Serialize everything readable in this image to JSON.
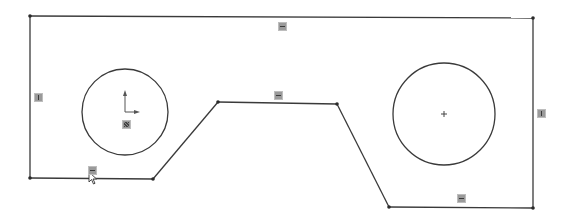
{
  "sketch": {
    "profile_points": [
      [
        30,
        16
      ],
      [
        533,
        18
      ],
      [
        533,
        208
      ],
      [
        389,
        207
      ],
      [
        337,
        104
      ],
      [
        218,
        102
      ],
      [
        153,
        179
      ],
      [
        30,
        178
      ]
    ],
    "circles": [
      {
        "name": "left-hole",
        "cx": 125,
        "cy": 112,
        "r": 43
      },
      {
        "name": "right-hole",
        "cx": 444,
        "cy": 114,
        "r": 51
      }
    ],
    "relations": [
      {
        "name": "relation-horizontal-top",
        "type": "horizontal",
        "x": 278,
        "y": 22
      },
      {
        "name": "relation-vertical-left",
        "type": "vertical",
        "x": 34,
        "y": 93
      },
      {
        "name": "relation-horizontal-middle",
        "type": "horizontal",
        "x": 274,
        "y": 91
      },
      {
        "name": "relation-vertical-right",
        "type": "vertical",
        "x": 537,
        "y": 109
      },
      {
        "name": "relation-horizontal-bottom-left",
        "type": "horizontal",
        "x": 88,
        "y": 166
      },
      {
        "name": "relation-horizontal-bottom-right",
        "type": "horizontal",
        "x": 457,
        "y": 194
      },
      {
        "name": "relation-fix-origin",
        "type": "fix",
        "x": 122,
        "y": 120
      }
    ],
    "colors": {
      "line": "#3a3a3a",
      "background": "#ffffff",
      "badge": "#9a9a9a"
    }
  }
}
